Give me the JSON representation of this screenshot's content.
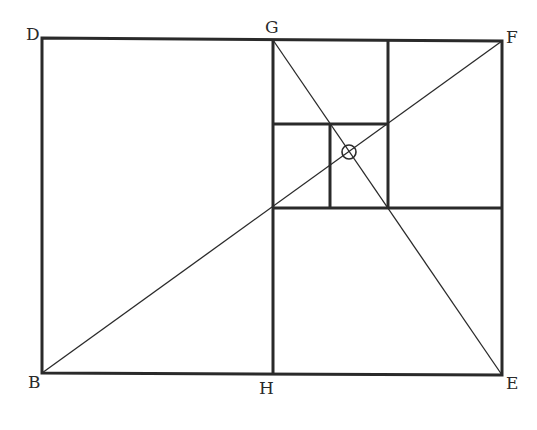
{
  "diagram": {
    "type": "golden-rectangle-construction",
    "labels": {
      "D": "D",
      "G": "G",
      "F": "F",
      "B": "B",
      "H": "H",
      "E": "E",
      "O": "O"
    },
    "colors": {
      "stroke": "#2a2a2a",
      "background": "#ffffff"
    }
  }
}
